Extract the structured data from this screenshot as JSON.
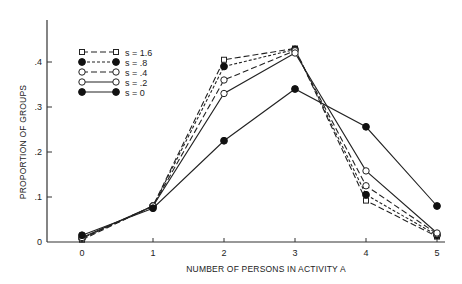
{
  "chart_data": {
    "type": "line",
    "title": "",
    "xlabel": "NUMBER OF PERSONS IN ACTIVITY  A",
    "ylabel": "PROPORTION OF GROUPS",
    "x": [
      0,
      1,
      2,
      3,
      4,
      5
    ],
    "xlim": [
      -0.45,
      5.1
    ],
    "ylim": [
      0,
      0.44
    ],
    "x_ticks": [
      "0",
      "1",
      "2",
      "3",
      "4",
      "5"
    ],
    "y_ticks": [
      {
        "value": 0,
        "label": "0"
      },
      {
        "value": 0.1,
        "label": ".1"
      },
      {
        "value": 0.2,
        "label": ".2"
      },
      {
        "value": 0.3,
        "label": ".3"
      },
      {
        "value": 0.4,
        "label": ".4"
      }
    ],
    "grid": false,
    "legend_position": "upper-left",
    "series": [
      {
        "name": "s = 1.6",
        "legend_label": "s = 1.6",
        "marker": "open-square",
        "line": "dashed-long",
        "values": [
          0.005,
          0.08,
          0.405,
          0.43,
          0.092,
          0.012
        ]
      },
      {
        "name": "s = .8",
        "legend_label": "s =  .8",
        "marker": "filled-circle",
        "line": "dashed-short",
        "values": [
          0.008,
          0.08,
          0.39,
          0.428,
          0.105,
          0.015
        ]
      },
      {
        "name": "s = .4",
        "legend_label": "s =  .4",
        "marker": "open-circle",
        "line": "dashed-long",
        "values": [
          0.008,
          0.08,
          0.36,
          0.425,
          0.125,
          0.018
        ]
      },
      {
        "name": "s = .2",
        "legend_label": "s =  .2",
        "marker": "open-circle",
        "line": "solid",
        "values": [
          0.01,
          0.08,
          0.33,
          0.42,
          0.158,
          0.02
        ]
      },
      {
        "name": "s = 0",
        "legend_label": "s =   0",
        "marker": "filled-circle",
        "line": "solid",
        "values": [
          0.015,
          0.075,
          0.225,
          0.34,
          0.256,
          0.08
        ]
      }
    ]
  }
}
